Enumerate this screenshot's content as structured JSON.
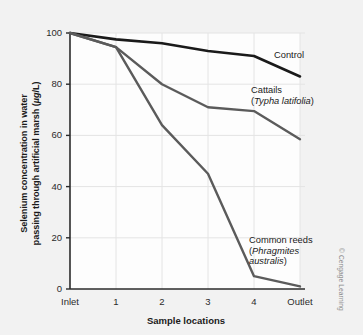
{
  "figure": {
    "credit": "© Cengage Learning",
    "background_color": "#f2f2f2",
    "plot_background_color": "#fdfdfd"
  },
  "chart_data": {
    "type": "line",
    "title": "",
    "xlabel": "Sample locations",
    "ylabel": "Selenium concentration in water passing through artificial marsh (µg/L)",
    "ylabel_line1": "Selenium concentration in water",
    "ylabel_line2_pre": "passing through artificial marsh (",
    "ylabel_line2_unit": "µg",
    "ylabel_line2_post": "/L)",
    "categories": [
      "Inlet",
      "1",
      "2",
      "3",
      "4",
      "Outlet"
    ],
    "x": [
      0,
      1,
      2,
      3,
      4,
      5
    ],
    "ylim": [
      0,
      100
    ],
    "xlim": [
      0,
      5
    ],
    "yticks": [
      0,
      20,
      40,
      60,
      80,
      100
    ],
    "ytick_labels": [
      "0",
      "20",
      "40",
      "60",
      "80",
      "100"
    ],
    "xtick_labels": [
      "Inlet",
      "1",
      "2",
      "3",
      "4",
      "Outlet"
    ],
    "grid": true,
    "grid_color": "#e4e4e4",
    "legend_position": "inline-annotations",
    "series": [
      {
        "name": "Control",
        "label": "Control",
        "label_lines": [
          "Control"
        ],
        "color": "#1a1a1a",
        "line_width": 2.6,
        "values": [
          100,
          97.5,
          96,
          93,
          91,
          83
        ]
      },
      {
        "name": "Cattails",
        "label": "Cattails (Typha latifolia)",
        "label_lines": [
          "Cattails",
          "(Typha latifolia)"
        ],
        "label_line1": "Cattails",
        "label_line2_open": "(",
        "label_line2_sci": "Typha latifolia",
        "label_line2_close": ")",
        "color": "#5b5b5b",
        "line_width": 2.4,
        "values": [
          100,
          94.5,
          80,
          71,
          69.5,
          58.5
        ]
      },
      {
        "name": "Common reeds",
        "label": "Common reeds (Phragmites australis)",
        "label_lines": [
          "Common reeds",
          "(Phragmites",
          "australis)"
        ],
        "label_line1": "Common reeds",
        "label_line2_open": "(",
        "label_line2_sci": "Phragmites",
        "label_line3_sci": "australis",
        "label_line3_close": ")",
        "color": "#5b5b5b",
        "line_width": 2.4,
        "values": [
          100,
          94.5,
          64,
          45,
          5,
          1
        ]
      }
    ]
  }
}
